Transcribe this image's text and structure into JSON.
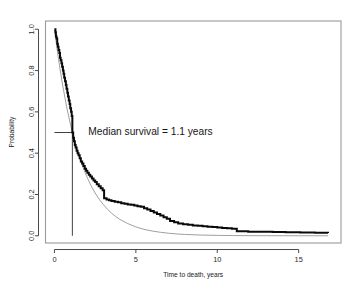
{
  "chart_data": {
    "type": "line",
    "title": "",
    "subtitle": "",
    "xlabel": "Time to death, years",
    "ylabel": "Probability",
    "xlim": [
      -0.55,
      17.6
    ],
    "ylim": [
      -0.035,
      1.04
    ],
    "xticks": [
      0,
      5,
      10,
      15
    ],
    "xticklabels": [
      "0",
      "5",
      "10",
      "15"
    ],
    "yticks": [
      0.0,
      0.2,
      0.4,
      0.6,
      0.8,
      1.0
    ],
    "yticklabels": [
      "0.0",
      "0.2",
      "0.4",
      "0.6",
      "0.8",
      "1.0"
    ],
    "grid": false,
    "legend": false,
    "legend_position": "none",
    "annotations": [
      {
        "name": "median-survival-annotation",
        "text": "Median survival = 1.1 years",
        "x": 5.9,
        "y": 0.505
      }
    ],
    "reference_lines": [
      {
        "name": "median-horizontal-line",
        "orientation": "horizontal",
        "y": 0.5,
        "x_from": 0.0,
        "x_to": 1.1
      },
      {
        "name": "median-vertical-line",
        "orientation": "vertical",
        "x": 1.1,
        "y_from": 0.0,
        "y_to": 0.5
      }
    ],
    "median_survival_years": 1.1,
    "series": [
      {
        "name": "Kaplan-Meier survival estimate",
        "style": "step",
        "color": "#0a0a0a",
        "x": [
          0.0,
          0.06,
          0.09,
          0.13,
          0.17,
          0.21,
          0.25,
          0.3,
          0.34,
          0.38,
          0.43,
          0.47,
          0.52,
          0.56,
          0.6,
          0.65,
          0.7,
          0.74,
          0.79,
          0.83,
          0.88,
          0.93,
          0.97,
          1.02,
          1.06,
          1.1,
          1.15,
          1.2,
          1.25,
          1.3,
          1.36,
          1.42,
          1.48,
          1.55,
          1.62,
          1.7,
          1.78,
          1.86,
          1.94,
          2.02,
          2.11,
          2.2,
          2.3,
          2.4,
          2.5,
          2.6,
          2.72,
          2.84,
          2.96,
          3.05,
          3.2,
          3.35,
          3.5,
          3.7,
          3.9,
          4.1,
          4.3,
          4.5,
          4.7,
          4.9,
          5.1,
          5.3,
          5.5,
          5.7,
          5.9,
          6.1,
          6.3,
          6.5,
          6.7,
          6.9,
          7.1,
          7.35,
          7.6,
          7.9,
          8.2,
          8.5,
          8.8,
          9.1,
          9.4,
          9.7,
          10.0,
          10.3,
          10.6,
          10.9,
          11.2,
          11.9,
          12.6,
          13.4,
          14.2,
          15.1,
          16.0,
          16.8
        ],
        "y": [
          1.0,
          0.985,
          0.965,
          0.955,
          0.93,
          0.915,
          0.9,
          0.885,
          0.862,
          0.85,
          0.835,
          0.818,
          0.8,
          0.785,
          0.765,
          0.748,
          0.73,
          0.712,
          0.693,
          0.675,
          0.655,
          0.638,
          0.618,
          0.6,
          0.58,
          0.5,
          0.475,
          0.458,
          0.44,
          0.428,
          0.412,
          0.4,
          0.39,
          0.375,
          0.36,
          0.35,
          0.338,
          0.325,
          0.315,
          0.305,
          0.295,
          0.287,
          0.277,
          0.268,
          0.26,
          0.25,
          0.24,
          0.23,
          0.22,
          0.182,
          0.176,
          0.172,
          0.168,
          0.165,
          0.162,
          0.158,
          0.155,
          0.152,
          0.15,
          0.147,
          0.143,
          0.14,
          0.133,
          0.127,
          0.12,
          0.113,
          0.105,
          0.098,
          0.09,
          0.082,
          0.072,
          0.066,
          0.06,
          0.056,
          0.053,
          0.05,
          0.048,
          0.046,
          0.044,
          0.042,
          0.04,
          0.038,
          0.036,
          0.034,
          0.022,
          0.02,
          0.019,
          0.018,
          0.017,
          0.016,
          0.015,
          0.014
        ]
      },
      {
        "name": "Exponential model fit",
        "style": "smooth",
        "color": "#8e8e8e",
        "x": [
          0.0,
          0.25,
          0.5,
          0.75,
          1.0,
          1.25,
          1.5,
          1.75,
          2.0,
          2.25,
          2.5,
          2.75,
          3.0,
          3.25,
          3.5,
          3.75,
          4.0,
          4.5,
          5.0,
          5.5,
          6.0,
          6.5,
          7.0,
          7.5,
          8.0,
          9.0,
          10.0,
          11.0,
          12.0,
          13.0,
          14.0,
          15.0,
          16.0,
          16.8
        ],
        "y": [
          1.0,
          0.854,
          0.73,
          0.624,
          0.533,
          0.455,
          0.389,
          0.332,
          0.284,
          0.242,
          0.207,
          0.177,
          0.151,
          0.129,
          0.11,
          0.094,
          0.08,
          0.059,
          0.043,
          0.031,
          0.023,
          0.017,
          0.0123,
          0.009,
          0.0065,
          0.0035,
          0.0019,
          0.001,
          0.0005,
          0.0003,
          0.0002,
          0.0001,
          5e-05,
          3e-05
        ]
      }
    ]
  }
}
